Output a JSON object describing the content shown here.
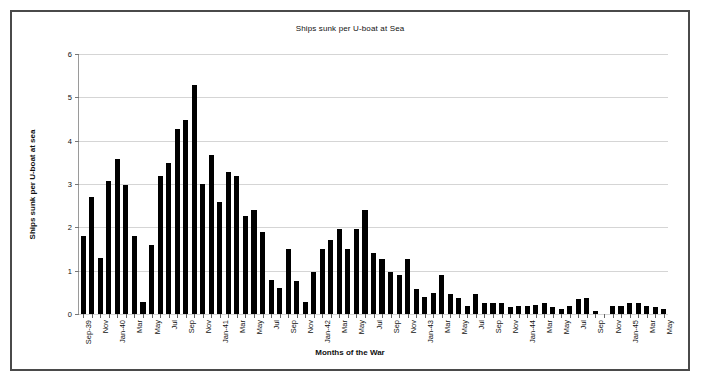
{
  "chart_data": {
    "type": "bar",
    "title": "Ships sunk per U-boat at Sea",
    "xlabel": "Months of the War",
    "ylabel": "Ships sunk per U-boat at sea",
    "ylim": [
      0,
      6
    ],
    "yticks": [
      0,
      1,
      2,
      3,
      4,
      5,
      6
    ],
    "ytick_labels": [
      "0",
      "1",
      "2",
      "3",
      "4",
      "5",
      "6"
    ],
    "grid": true,
    "legend": false,
    "legend_position": "none",
    "bar_color": "#000000",
    "categories": [
      "Sep-39",
      "Oct-39",
      "Nov-39",
      "Dec-39",
      "Jan-40",
      "Feb-40",
      "Mar-40",
      "Apr-40",
      "May-40",
      "Jun-40",
      "Jul-40",
      "Aug-40",
      "Sep-40",
      "Oct-40",
      "Nov-40",
      "Dec-40",
      "Jan-41",
      "Feb-41",
      "Mar-41",
      "Apr-41",
      "May-41",
      "Jun-41",
      "Jul-41",
      "Aug-41",
      "Sep-41",
      "Oct-41",
      "Nov-41",
      "Dec-41",
      "Jan-42",
      "Feb-42",
      "Mar-42",
      "Apr-42",
      "May-42",
      "Jun-42",
      "Jul-42",
      "Aug-42",
      "Sep-42",
      "Oct-42",
      "Nov-42",
      "Dec-42",
      "Jan-43",
      "Feb-43",
      "Mar-43",
      "Apr-43",
      "May-43",
      "Jun-43",
      "Jul-43",
      "Aug-43",
      "Sep-43",
      "Oct-43",
      "Nov-43",
      "Dec-43",
      "Jan-44",
      "Feb-44",
      "Mar-44",
      "Apr-44",
      "May-44",
      "Jun-44",
      "Jul-44",
      "Aug-44",
      "Sep-44",
      "Oct-44",
      "Nov-44",
      "Dec-44",
      "Jan-45",
      "Feb-45",
      "Mar-45",
      "Apr-45",
      "May-45"
    ],
    "tick_labels_shown": [
      "Sep-39",
      "Nov",
      "Jan-40",
      "Mar",
      "May",
      "Jul",
      "Sep",
      "Nov",
      "Jan-41",
      "Mar",
      "May",
      "Jul",
      "Sep",
      "Nov",
      "Jan-42",
      "Mar",
      "May",
      "Jul",
      "Sep",
      "Nov",
      "Jan-43",
      "Mar",
      "May",
      "Jul",
      "Sep",
      "Nov",
      "Jan-44",
      "Mar",
      "May",
      "Jul",
      "Sep",
      "Nov",
      "Jan-45",
      "Mar",
      "May"
    ],
    "values": [
      1.8,
      2.7,
      1.3,
      3.08,
      3.58,
      2.98,
      1.8,
      0.28,
      1.6,
      3.18,
      3.48,
      4.27,
      4.47,
      5.28,
      2.99,
      3.68,
      2.58,
      3.27,
      3.18,
      2.27,
      2.39,
      1.89,
      0.78,
      0.59,
      1.49,
      0.77,
      0.28,
      0.98,
      1.49,
      1.7,
      1.97,
      1.49,
      1.97,
      2.39,
      1.4,
      1.27,
      0.98,
      0.9,
      1.27,
      0.58,
      0.4,
      0.48,
      0.89,
      0.47,
      0.38,
      0.18,
      0.47,
      0.25,
      0.26,
      0.25,
      0.17,
      0.18,
      0.19,
      0.2,
      0.26,
      0.17,
      0.11,
      0.18,
      0.35,
      0.36,
      0.07,
      0.0,
      0.18,
      0.19,
      0.25,
      0.26,
      0.18,
      0.17,
      0.12
    ]
  }
}
